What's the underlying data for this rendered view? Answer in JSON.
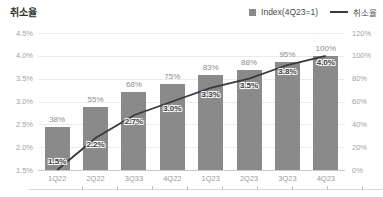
{
  "title": "취소율",
  "legend": [
    {
      "marker": "square",
      "label": "Index(4Q23=1)",
      "color": "#8a8a8a"
    },
    {
      "marker": "line",
      "label": "취소율",
      "color": "#3a3a3a"
    }
  ],
  "colors": {
    "bar": "#8a8a8a",
    "line": "#3a3a3a",
    "grid": "#ebebeb",
    "baseline": "#c9c9c9",
    "axis_text": "#a3a3a3",
    "bar_label": "#8d8d8d",
    "line_label": "#3c3c3c"
  },
  "chart_data": {
    "type": "bar",
    "subtype": "bar-and-line-dual-axis",
    "title": "취소율",
    "categories": [
      "1Q22",
      "2Q22",
      "3Q33",
      "4Q22",
      "1Q23",
      "2Q23",
      "3Q23",
      "4Q23"
    ],
    "series": [
      {
        "name": "Index(4Q23=1)",
        "type": "bar",
        "axis": "right",
        "values": [
          38,
          55,
          68,
          75,
          83,
          88,
          95,
          100
        ],
        "labels": [
          "38%",
          "55%",
          "68%",
          "75%",
          "83%",
          "88%",
          "95%",
          "100%"
        ]
      },
      {
        "name": "취소율",
        "type": "line",
        "axis": "left",
        "values": [
          1.5,
          2.2,
          2.7,
          3.0,
          3.3,
          3.5,
          3.8,
          4.0
        ],
        "labels": [
          "1.5%",
          "2.2%",
          "2.7%",
          "3.0%",
          "3.3%",
          "3.5%",
          "3.8%",
          "4.0%"
        ]
      }
    ],
    "left_axis": {
      "min": 1.5,
      "max": 4.5,
      "ticks": [
        "4.5%",
        "4.0%",
        "3.5%",
        "3.0%",
        "2.5%",
        "2.0%",
        "1.5%"
      ]
    },
    "right_axis": {
      "min": 0,
      "max": 120,
      "ticks": [
        "120%",
        "100%",
        "80%",
        "60%",
        "40%",
        "20%",
        "0%"
      ]
    },
    "grid": true,
    "legend_position": "top-right"
  }
}
